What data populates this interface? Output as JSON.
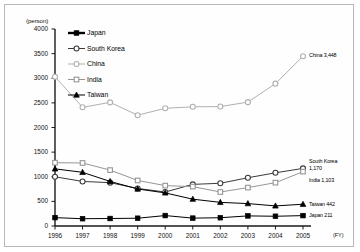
{
  "axis": {
    "unit_label": "(person)",
    "fy_label": "(FY)",
    "y_ticks": [
      "4000",
      "3500",
      "3000",
      "2500",
      "2000",
      "1500",
      "1000",
      "500",
      "0"
    ],
    "y_min": 0,
    "y_max": 4000,
    "y_step": 500,
    "x_ticks": [
      "1996",
      "1997",
      "1998",
      "1999",
      "2000",
      "2001",
      "2002",
      "2003",
      "2004",
      "2005"
    ]
  },
  "legend": {
    "items": [
      {
        "label": "Japan",
        "marker": "filled-square",
        "color": "#000000"
      },
      {
        "label": "South Korea",
        "marker": "open-circle",
        "color": "#3a3a3a"
      },
      {
        "label": "China",
        "marker": "open-circle",
        "color": "#b0b0b0"
      },
      {
        "label": "India",
        "marker": "open-square",
        "color": "#969696"
      },
      {
        "label": "Taiwan",
        "marker": "filled-triangle",
        "color": "#000000"
      }
    ]
  },
  "end_labels": [
    {
      "name": "china-end-label",
      "text": "China 3,448"
    },
    {
      "name": "south-korea-end-label",
      "text": "South Korea"
    },
    {
      "name": "south-korea-end-value",
      "text": "1,170"
    },
    {
      "name": "india-end-label",
      "text": "India 1,103"
    },
    {
      "name": "taiwan-end-label",
      "text": "Taiwan 442"
    },
    {
      "name": "japan-end-label",
      "text": "Japan 211"
    }
  ],
  "chart_data": {
    "type": "line",
    "title": "",
    "xlabel": "(FY)",
    "ylabel": "(person)",
    "ylim": [
      0,
      4000
    ],
    "grid": false,
    "legend_position": "top-left",
    "x": [
      "1996",
      "1997",
      "1998",
      "1999",
      "2000",
      "2001",
      "2002",
      "2003",
      "2004",
      "2005"
    ],
    "series": [
      {
        "name": "Japan",
        "marker": "filled-square",
        "color": "#000000",
        "values": [
          170,
          148,
          152,
          158,
          212,
          160,
          168,
          205,
          198,
          211
        ]
      },
      {
        "name": "South Korea",
        "marker": "open-circle",
        "color": "#3a3a3a",
        "values": [
          1000,
          905,
          880,
          762,
          690,
          845,
          868,
          980,
          1080,
          1170
        ]
      },
      {
        "name": "China",
        "marker": "open-circle",
        "color": "#b0b0b0",
        "values": [
          3030,
          2410,
          2510,
          2250,
          2390,
          2420,
          2425,
          2515,
          2890,
          3448
        ]
      },
      {
        "name": "India",
        "marker": "open-square",
        "color": "#969696",
        "values": [
          1285,
          1280,
          1135,
          925,
          820,
          800,
          690,
          780,
          880,
          1103
        ]
      },
      {
        "name": "Taiwan",
        "marker": "filled-triangle",
        "color": "#000000",
        "values": [
          1160,
          1090,
          905,
          752,
          672,
          545,
          480,
          455,
          408,
          442
        ]
      }
    ]
  }
}
